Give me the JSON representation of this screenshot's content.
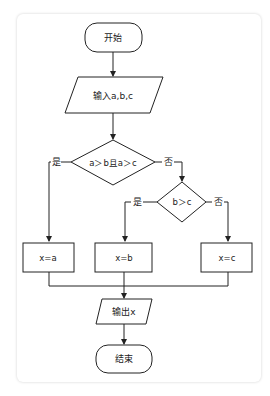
{
  "diagram": {
    "type": "flowchart",
    "nodes": {
      "start": {
        "label": "开始",
        "shape": "terminator"
      },
      "input": {
        "label": "输入a,b,c",
        "shape": "parallelogram"
      },
      "cond1": {
        "label": "a＞b且a＞c",
        "shape": "diamond"
      },
      "cond2": {
        "label": "b＞c",
        "shape": "diamond"
      },
      "assign_a": {
        "label": "x=a",
        "shape": "process"
      },
      "assign_b": {
        "label": "x=b",
        "shape": "process"
      },
      "assign_c": {
        "label": "x=c",
        "shape": "process"
      },
      "output": {
        "label": "输出x",
        "shape": "parallelogram"
      },
      "end": {
        "label": "结束",
        "shape": "terminator"
      }
    },
    "edges": {
      "cond1_yes": "是",
      "cond1_no": "否",
      "cond2_yes": "是",
      "cond2_no": "否"
    },
    "colors": {
      "stroke": "#222222",
      "background": "#ffffff"
    }
  }
}
